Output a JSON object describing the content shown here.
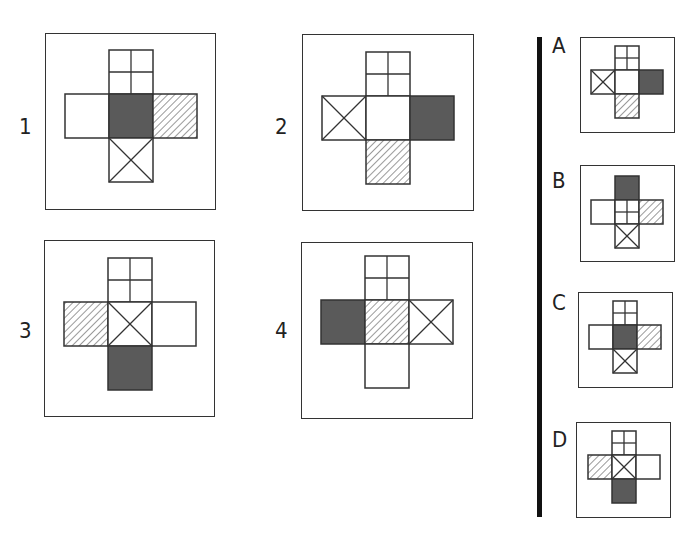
{
  "chart_data": {
    "type": "diagram",
    "title": "",
    "face_patterns": {
      "grid": "2x2 subdivided square",
      "x": "square with diagonal cross",
      "dark": "solid dark gray fill",
      "hatch": "diagonal hatched lines",
      "blank": "empty white square"
    },
    "colors": {
      "dark": "#5a5a5a",
      "line": "#333333",
      "hatch": "#555555",
      "divider": "#111111"
    },
    "puzzles": [
      {
        "label": "1",
        "top": "grid",
        "left": "blank",
        "center": "dark",
        "right": "hatch",
        "bottom": "x"
      },
      {
        "label": "2",
        "top": "grid",
        "left": "x",
        "center": "blank",
        "right": "dark",
        "bottom": "hatch"
      },
      {
        "label": "3",
        "top": "grid",
        "left": "hatch",
        "center": "x",
        "right": "blank",
        "bottom": "dark"
      },
      {
        "label": "4",
        "top": "grid",
        "left": "dark",
        "center": "hatch",
        "right": "x",
        "bottom": "blank"
      }
    ],
    "options": [
      {
        "label": "A",
        "top": "grid",
        "left": "x",
        "center": "blank",
        "right": "dark",
        "bottom": "hatch"
      },
      {
        "label": "B",
        "top": "dark",
        "left": "blank",
        "center": "grid",
        "right": "hatch",
        "bottom": "x"
      },
      {
        "label": "C",
        "top": "grid",
        "left": "blank",
        "center": "dark",
        "right": "hatch",
        "bottom": "x"
      },
      {
        "label": "D",
        "top": "grid",
        "left": "hatch",
        "center": "x",
        "right": "blank",
        "bottom": "dark"
      }
    ]
  },
  "labels": {
    "p1": "1",
    "p2": "2",
    "p3": "3",
    "p4": "4",
    "oA": "A",
    "oB": "B",
    "oC": "C",
    "oD": "D"
  }
}
